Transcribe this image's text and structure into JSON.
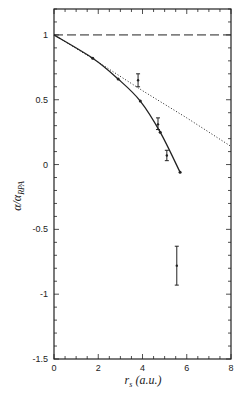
{
  "chart_data": {
    "type": "line",
    "title": "",
    "xlabel": "r_s (a.u.)",
    "ylabel": "α/α_RPA",
    "xlim": [
      0,
      8
    ],
    "ylim": [
      -1.5,
      1.2
    ],
    "x_ticks": [
      0,
      2,
      4,
      6,
      8
    ],
    "x_tick_labels": [
      "0",
      "2",
      "4",
      "6",
      "8"
    ],
    "y_ticks": [
      1,
      0.5,
      0,
      -0.5,
      -1,
      -1.5
    ],
    "y_tick_labels": [
      "1",
      "0.5",
      "0",
      "-0.5",
      "-1",
      "-1.5"
    ],
    "grid": false,
    "legend": null,
    "series": [
      {
        "name": "RPA reference",
        "style": "dashed",
        "x": [
          0,
          8
        ],
        "y": [
          1.0,
          1.0
        ]
      },
      {
        "name": "dotted approximation",
        "style": "dotted",
        "x": [
          0,
          2,
          4,
          6,
          8
        ],
        "y": [
          1.0,
          0.79,
          0.57,
          0.36,
          0.14
        ]
      },
      {
        "name": "solid curve",
        "style": "solid",
        "x": [
          0,
          1.75,
          2.9,
          3.9,
          4.8,
          5.7
        ],
        "y": [
          1.0,
          0.82,
          0.66,
          0.49,
          0.25,
          -0.06
        ],
        "markers": [
          {
            "x": 1.75,
            "y": 0.82
          },
          {
            "x": 2.9,
            "y": 0.66
          },
          {
            "x": 3.9,
            "y": 0.49
          },
          {
            "x": 4.8,
            "y": 0.25
          },
          {
            "x": 5.7,
            "y": -0.06
          }
        ]
      },
      {
        "name": "data with error bars",
        "style": "errorbar",
        "points": [
          {
            "x": 3.8,
            "y": 0.65,
            "ymin": 0.6,
            "ymax": 0.7
          },
          {
            "x": 4.7,
            "y": 0.31,
            "ymin": 0.27,
            "ymax": 0.36
          },
          {
            "x": 5.1,
            "y": 0.07,
            "ymin": 0.03,
            "ymax": 0.11
          },
          {
            "x": 5.55,
            "y": -0.78,
            "ymin": -0.93,
            "ymax": -0.63
          }
        ]
      }
    ]
  },
  "labels": {
    "xlabel_main": "r",
    "xlabel_sub": "s",
    "xlabel_units": " (a.u.)",
    "ylabel_main": "α/α",
    "ylabel_sub": "RPA"
  }
}
